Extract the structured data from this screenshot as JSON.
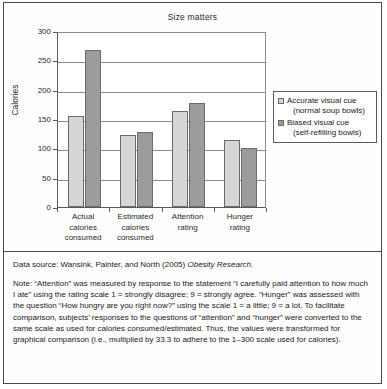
{
  "figure": {
    "data_source_prefix": "Data source: Wansink, Painter, and North (2005) ",
    "data_source_italic": "Obesity Research.",
    "note": "Note: “Attention” was measured by response to the statement “I carefully paid attention to how much I ate” using the rating scale 1 = strongly disagree; 9 = strongly agree. “Hunger” was assessed with the question “How hungry are you right now?” using the scale 1 = a little; 9 = a lot. To facilitate comparison, subjects’ responses to the questions of “attention” and “hunger” were converted to the same scale as used for calories consumed/estimated. Thus, the values were transformed for graphical comparison (i.e., multiplied by 33.3 to adhere to the 1–300 scale used for calories)."
  },
  "chart_data": {
    "type": "bar",
    "title": "Size matters",
    "xlabel": "",
    "ylabel": "Calories",
    "ylim": [
      0,
      300
    ],
    "yticks": [
      0,
      50,
      100,
      150,
      200,
      250,
      300
    ],
    "ytick_labels": [
      "0",
      "50",
      "100",
      "150",
      "200",
      "250",
      "300"
    ],
    "grid": true,
    "legend_position": "right",
    "categories": [
      "Actual calories consumed",
      "Estimated calories consumed",
      "Attention rating",
      "Hunger rating"
    ],
    "category_lines": [
      [
        "Actual",
        "calories",
        "consumed"
      ],
      [
        "Estimated",
        "calories",
        "consumed"
      ],
      [
        "Attention",
        "rating"
      ],
      [
        "Hunger",
        "rating"
      ]
    ],
    "series": [
      {
        "name": "Accurate visual cue (normal soup bowls)",
        "legend_line1": "Accurate visual cue",
        "legend_line2": "(normal soup bowls)",
        "color": "#d6d6d6",
        "values": [
          155,
          123,
          163,
          115
        ]
      },
      {
        "name": "Biased visual cue (self-refilling bowls)",
        "legend_line1": "Biased visual cue",
        "legend_line2": "(self-refilling bowls)",
        "color": "#9c9c9c",
        "values": [
          268,
          128,
          178,
          100
        ]
      }
    ]
  }
}
